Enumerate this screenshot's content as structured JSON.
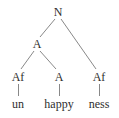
{
  "diagram": {
    "type": "morphology-tree",
    "nodes": {
      "root": {
        "label": "N"
      },
      "adj": {
        "label": "A"
      },
      "prefix": {
        "label": "Af"
      },
      "stem": {
        "label": "A"
      },
      "suffix": {
        "label": "Af"
      }
    },
    "leaves": {
      "prefix_word": "un",
      "stem_word": "happy",
      "suffix_word": "ness"
    },
    "edges": [
      [
        "N",
        "A"
      ],
      [
        "N",
        "Af (ness)"
      ],
      [
        "A",
        "Af (un)"
      ],
      [
        "A",
        "A (happy)"
      ],
      [
        "Af (un)",
        "un"
      ],
      [
        "A (happy)",
        "happy"
      ],
      [
        "Af (ness)",
        "ness"
      ]
    ],
    "colors": {
      "text": "#2e2e2e",
      "lines": "#7a7a7a",
      "background": "#ffffff"
    }
  }
}
